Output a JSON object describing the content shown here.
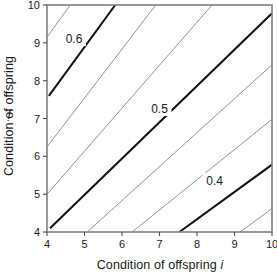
{
  "chart_data": {
    "type": "line",
    "subtype": "contour",
    "title": "",
    "xlabel": "Condition of offspring i",
    "ylabel": "Condition of offspring j",
    "xlim": [
      4,
      10
    ],
    "ylim": [
      4,
      10
    ],
    "xticks": [
      4,
      5,
      6,
      7,
      8,
      9,
      10
    ],
    "yticks": [
      4,
      5,
      6,
      7,
      8,
      9,
      10
    ],
    "xtick_labels": [
      "4",
      "5",
      "6",
      "7",
      "8",
      "9",
      "10"
    ],
    "ytick_labels": [
      "4",
      "5",
      "6",
      "7",
      "8",
      "9",
      "10"
    ],
    "grid": false,
    "legend": null,
    "contour_levels": [
      0.4,
      0.5,
      0.6
    ],
    "labeled_levels": [
      "0.6",
      "0.5",
      "0.4"
    ],
    "minor_levels_unlabeled": 5,
    "contours": [
      {
        "id": "c1",
        "level": null,
        "weight": "thin",
        "label": "",
        "x_start": 4.0,
        "y_start": 9.15,
        "x_end": 4.62,
        "y_end": 10.0
      },
      {
        "id": "c2",
        "level": 0.6,
        "weight": "thick",
        "label": "0.6",
        "label_x": 4.72,
        "label_y": 9.1,
        "x_start": 4.05,
        "y_start": 7.6,
        "x_end": 5.82,
        "y_end": 10.0
      },
      {
        "id": "c3",
        "level": null,
        "weight": "thin",
        "label": "",
        "x_start": 4.0,
        "y_start": 6.25,
        "x_end": 6.9,
        "y_end": 10.0
      },
      {
        "id": "c4",
        "level": null,
        "weight": "thin",
        "label": "",
        "x_start": 4.0,
        "y_start": 5.0,
        "x_end": 8.4,
        "y_end": 10.0
      },
      {
        "id": "c5",
        "level": 0.5,
        "weight": "thick",
        "label": "0.5",
        "label_x": 7.0,
        "label_y": 7.25,
        "x_start": 4.08,
        "y_start": 4.1,
        "x_end": 10.0,
        "y_end": 9.78
      },
      {
        "id": "c6",
        "level": null,
        "weight": "thin",
        "label": "",
        "x_start": 5.07,
        "y_start": 4.0,
        "x_end": 10.0,
        "y_end": 8.42
      },
      {
        "id": "c7",
        "level": null,
        "weight": "thin",
        "label": "",
        "x_start": 6.27,
        "y_start": 4.0,
        "x_end": 10.0,
        "y_end": 6.98
      },
      {
        "id": "c8",
        "level": 0.4,
        "weight": "thick",
        "label": "0.4",
        "label_x": 8.47,
        "label_y": 5.35,
        "x_start": 7.53,
        "y_start": 4.0,
        "x_end": 10.0,
        "y_end": 5.78
      },
      {
        "id": "c9",
        "level": null,
        "weight": "thin",
        "label": "",
        "x_start": 9.15,
        "y_start": 4.0,
        "x_end": 10.0,
        "y_end": 4.62
      }
    ],
    "style": {
      "frame_color": "#808080",
      "thick_line_color": "#111111",
      "thin_line_color": "#8c8c8c",
      "background": "#ffffff"
    }
  }
}
